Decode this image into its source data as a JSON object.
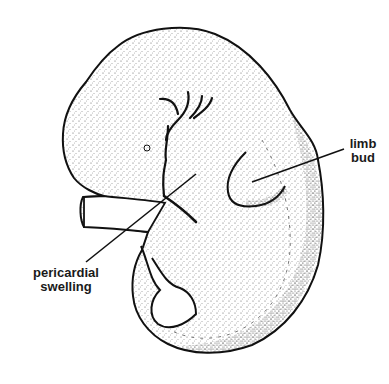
{
  "diagram": {
    "colors": {
      "outline": "#111111",
      "stipple": "#333333",
      "background": "#ffffff"
    },
    "labels": [
      {
        "id": "limb-bud",
        "lines": [
          "limb",
          "bud"
        ]
      },
      {
        "id": "pericardial-swelling",
        "lines": [
          "pericardial",
          "swelling"
        ]
      }
    ]
  }
}
